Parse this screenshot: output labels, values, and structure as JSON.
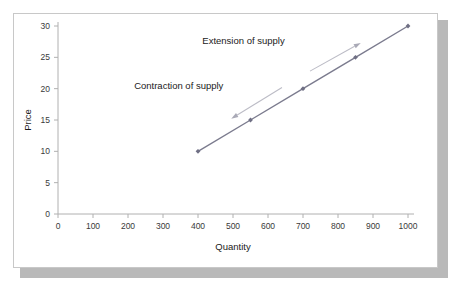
{
  "chart_data": {
    "type": "line",
    "title": "",
    "subtitle": "",
    "xlabel": "Quantity",
    "ylabel": "Price",
    "xlim": [
      0,
      1000
    ],
    "ylim": [
      0,
      30
    ],
    "xticks": [
      0,
      100,
      200,
      300,
      400,
      500,
      600,
      700,
      800,
      900,
      1000
    ],
    "xtick_labels": [
      "0",
      "100",
      "200",
      "300",
      "400",
      "500",
      "600",
      "700",
      "800",
      "900",
      "1000"
    ],
    "yticks": [
      0,
      5,
      10,
      15,
      20,
      25,
      30
    ],
    "ytick_labels": [
      "0",
      "5",
      "10",
      "15",
      "20",
      "25",
      "30"
    ],
    "grid": false,
    "legend": false,
    "series": [
      {
        "name": "Supply",
        "x": [
          400,
          550,
          700,
          850,
          1000
        ],
        "y": [
          10,
          15,
          20,
          25,
          30
        ],
        "color": "#7b7b8e",
        "marker": "diamond"
      }
    ],
    "annotations": [
      {
        "name": "extension-of-supply",
        "text": "Extension of supply",
        "text_x": 530,
        "text_y": 27.2,
        "arrow_from": {
          "x": 720,
          "y": 22.8
        },
        "arrow_to": {
          "x": 865,
          "y": 27.3
        },
        "direction": "up-right",
        "color": "#bcbcc6"
      },
      {
        "name": "contraction-of-supply",
        "text": "Contraction of supply",
        "text_x": 345,
        "text_y": 19.9,
        "arrow_from": {
          "x": 640,
          "y": 20.2
        },
        "arrow_to": {
          "x": 495,
          "y": 15.2
        },
        "direction": "down-left",
        "color": "#bcbcc6"
      }
    ]
  },
  "figure": {
    "background": "#ffffff",
    "card_background": "#ffffff",
    "card_border_color": "#c8c8c8",
    "shadow_color": "#b9b9b9",
    "axis_color": "#b0b0b0",
    "supply_color": "#7b7b8e",
    "annotation_color": "#bcbcc6"
  }
}
